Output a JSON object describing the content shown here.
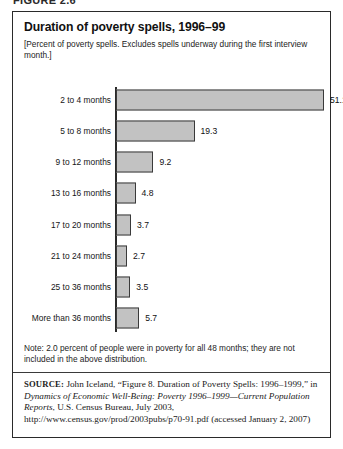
{
  "figure": {
    "caption": "FIGURE 2.6"
  },
  "chart": {
    "title": "Duration of poverty spells, 1996–99",
    "subtitle": "[Percent of poverty spells.  Excludes spells underway during the first interview month.]",
    "note": "Note: 2.0 percent of people were in poverty for all 48 months; they are not included in the above distribution."
  },
  "source": {
    "label": "SOURCE:",
    "text_part_1": " John Iceland, “Figure 8. Duration of Poverty Spells: 1996–1999,” in ",
    "italic_1": "Dynamics of Economic Well-Being: Poverty 1996–1999—Current Population Reports",
    "text_part_2": ", U.S. Census Bureau, July 2003, http://www.census.gov/prod/2003pubs/p70-91.pdf (accessed January 2, 2007)"
  },
  "chart_data": {
    "type": "bar",
    "orientation": "horizontal",
    "title": "Duration of poverty spells, 1996–99",
    "subtitle": "[Percent of poverty spells.  Excludes spells underway during the first interview month.]",
    "xlabel": "",
    "ylabel": "",
    "xlim": [
      0,
      51.1
    ],
    "grid": false,
    "legend": false,
    "categories": [
      "2 to 4 months",
      "5 to 8 months",
      "9 to 12 months",
      "13 to 16 months",
      "17 to 20 months",
      "21 to 24 months",
      "25 to 36 months",
      "More than 36 months"
    ],
    "values": [
      51.1,
      19.3,
      9.2,
      4.8,
      3.7,
      2.7,
      3.5,
      5.7
    ],
    "value_labels": [
      "51.1",
      "19.3",
      "9.2",
      "4.8",
      "3.7",
      "2.7",
      "3.5",
      "5.7"
    ],
    "units": "percent",
    "bar_color": "#c2c2c2",
    "bar_border_color": "#3a3a3a",
    "axis_color": "#2a2a2a"
  }
}
